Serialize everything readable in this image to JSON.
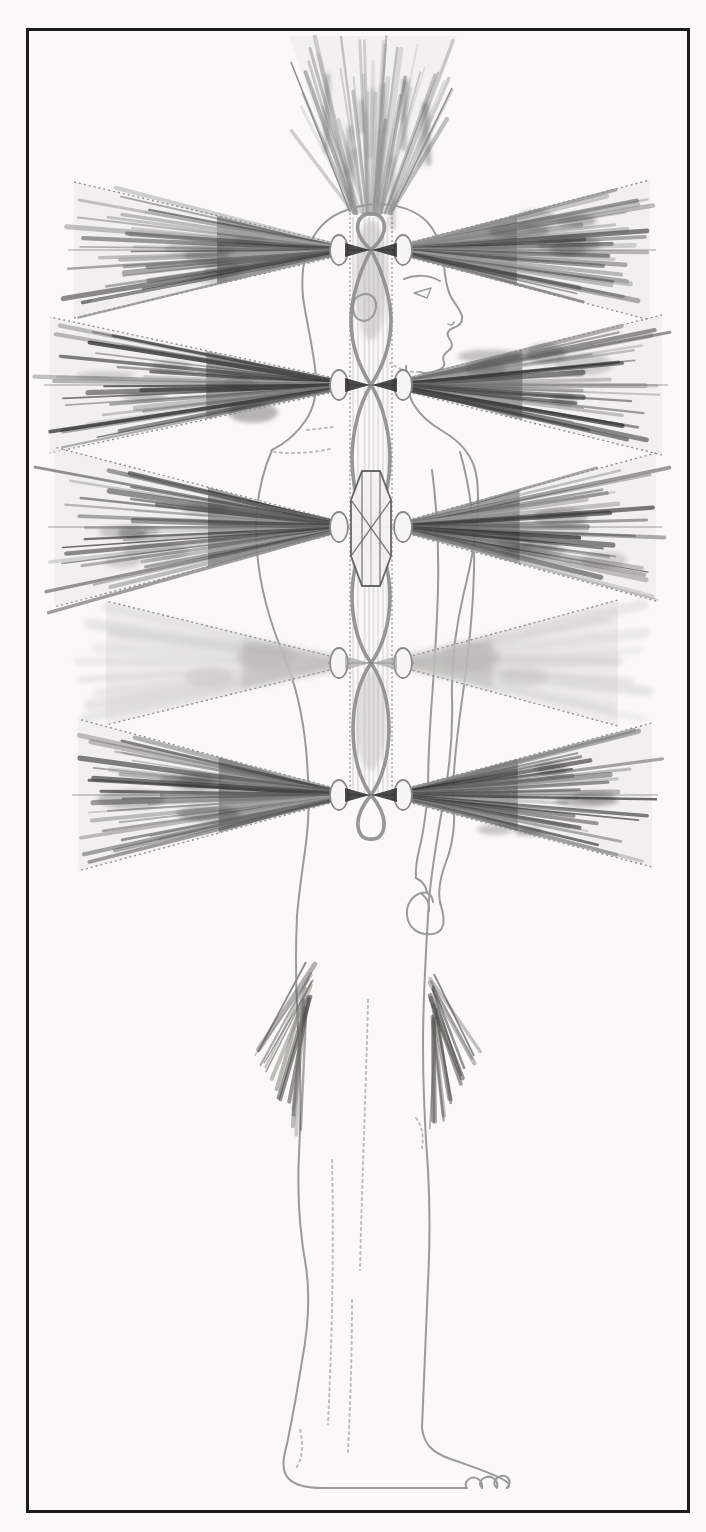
{
  "artwork": {
    "title": "Side-view figure of a standing human with chakra energy vortices",
    "background": "#faf9f6",
    "frame": {
      "color": "#1b1b1b",
      "thickness": 3,
      "left": 26,
      "top": 28,
      "width": 664,
      "height": 1485
    }
  },
  "palette": {
    "outline": "#9a9a98",
    "outline_soft": "#bcbbb7",
    "channel_fill_top": "#e3e2de",
    "channel_fill_bottom": "#d5d4d0",
    "channel_edge": "#9f9f9d",
    "weave": "#8d8d8b",
    "cone_paper": "#eae9e5",
    "cone_edge": "#8f8f8d",
    "bulb_fill": "#f6f5f1",
    "bulb_stroke": "#8a8a88",
    "bowtie_dark": "#262624",
    "bowtie_light": "#9a9a98",
    "diamond_stroke": "#5f5f5d",
    "fan_stroke": "#6b6a66"
  },
  "channel": {
    "x": 350,
    "width": 42,
    "top": 213,
    "straight_bottom": 796,
    "loop_bottom": 842,
    "center": 371
  },
  "crown": {
    "name": "crown-vortex-cone",
    "neck_y": 213,
    "top_y": 36,
    "neck_x": [
      350,
      392
    ],
    "top_x": [
      289,
      457
    ],
    "streaks": 46
  },
  "tips": {
    "rear_x": 334,
    "front_x": 408
  },
  "bulbs": {
    "rear_x": 339,
    "front_x": 403,
    "rx": 9,
    "ry": 15
  },
  "rows": [
    {
      "name": "chakra-row-1",
      "y": 250,
      "rear": {
        "end": 74,
        "spread": 68,
        "shade": "dark"
      },
      "front": {
        "end": 650,
        "spread": 70,
        "shade": "dark"
      },
      "bowtie": "dark"
    },
    {
      "name": "chakra-row-2",
      "y": 385,
      "rear": {
        "end": 50,
        "spread": 68,
        "shade": "dark"
      },
      "front": {
        "end": 662,
        "spread": 70,
        "shade": "dark"
      },
      "bowtie": "dark"
    },
    {
      "name": "chakra-row-3",
      "y": 527,
      "rear": {
        "end": 54,
        "spread": 80,
        "shade": "dark"
      },
      "front": {
        "end": 656,
        "spread": 74,
        "shade": "dark"
      },
      "bowtie": "none",
      "diamond": true
    },
    {
      "name": "chakra-row-4",
      "y": 663,
      "rear": {
        "end": 106,
        "spread": 62,
        "shade": "light"
      },
      "front": {
        "end": 618,
        "spread": 63,
        "shade": "light"
      },
      "bowtie": "light"
    },
    {
      "name": "chakra-row-5",
      "y": 795,
      "rear": {
        "end": 78,
        "spread": 76,
        "shade": "dark"
      },
      "front": {
        "end": 652,
        "spread": 72,
        "shade": "dark"
      },
      "bowtie": "dark"
    }
  ],
  "diamond": {
    "pts": [
      [
        351,
        500
      ],
      [
        362,
        471
      ],
      [
        380,
        471
      ],
      [
        391,
        500
      ],
      [
        391,
        556
      ],
      [
        380,
        586
      ],
      [
        362,
        586
      ],
      [
        351,
        556
      ]
    ],
    "cx": 371,
    "cy": 527
  },
  "hip_fans": [
    {
      "name": "hip-fan-rear",
      "edge": [
        306,
        962,
        258,
        1052
      ],
      "start_from": [
        313,
        968
      ],
      "start_to": [
        303,
        1014
      ],
      "end_from": [
        256,
        1048
      ],
      "end_to": [
        300,
        1132
      ],
      "count": 16
    },
    {
      "name": "hip-fan-front",
      "edge": [
        434,
        974,
        474,
        1056
      ],
      "start_from": [
        429,
        980
      ],
      "start_to": [
        437,
        1026
      ],
      "end_from": [
        476,
        1050
      ],
      "end_to": [
        434,
        1132
      ],
      "count": 16
    }
  ]
}
